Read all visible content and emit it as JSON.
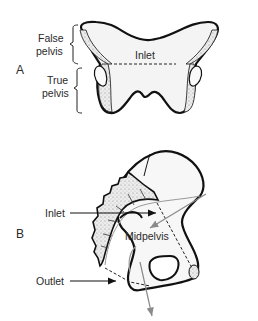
{
  "figure_a": {
    "panel_label": "A",
    "false_pelvis_line1": "False",
    "false_pelvis_line2": "pelvis",
    "true_pelvis_line1": "True",
    "true_pelvis_line2": "pelvis",
    "inlet_label": "Inlet"
  },
  "figure_b": {
    "panel_label": "B",
    "inlet_label": "Inlet",
    "midpelvis_label": "Midpelvis",
    "outlet_label": "Outlet"
  },
  "colors": {
    "outline": "#111111",
    "bone_fill": "#f4f4f4",
    "stipple": "#e2e2e2",
    "axis_arrow": "#8a8a8a"
  }
}
